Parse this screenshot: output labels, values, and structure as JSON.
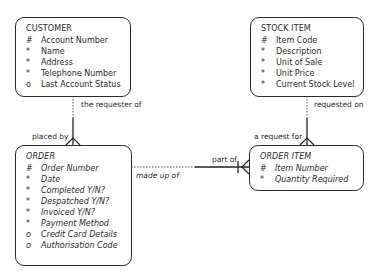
{
  "entities": {
    "customer": {
      "title": "CUSTOMER",
      "attributes": [
        {
          "mark": "#",
          "name": "Account Number"
        },
        {
          "mark": "*",
          "name": "Name"
        },
        {
          "mark": "*",
          "name": "Address"
        },
        {
          "mark": "*",
          "name": "Telephone Number"
        },
        {
          "mark": "o",
          "name": "Last Account Status"
        }
      ]
    },
    "stock_item": {
      "title": "STOCK ITEM",
      "attributes": [
        {
          "mark": "#",
          "name": "Item Code"
        },
        {
          "mark": "*",
          "name": "Description"
        },
        {
          "mark": "*",
          "name": "Unit of Sale"
        },
        {
          "mark": "*",
          "name": "Unit Price"
        },
        {
          "mark": "*",
          "name": "Current Stock Level"
        }
      ]
    },
    "order": {
      "title": "ORDER",
      "attributes": [
        {
          "mark": "#",
          "name": "Order Number"
        },
        {
          "mark": "*",
          "name": "Date"
        },
        {
          "mark": "*",
          "name": "Completed Y/N?"
        },
        {
          "mark": "*",
          "name": "Despatched Y/N?"
        },
        {
          "mark": "*",
          "name": "Invoiced Y/N?"
        },
        {
          "mark": "*",
          "name": "Payment Method"
        },
        {
          "mark": "o",
          "name": "Credit Card Details"
        },
        {
          "mark": "o",
          "name": "Authorisation Code"
        }
      ]
    },
    "order_item": {
      "title": "ORDER ITEM",
      "attributes": [
        {
          "mark": "#",
          "name": "Item Number"
        },
        {
          "mark": "*",
          "name": "Quantity Required"
        }
      ]
    }
  },
  "relationships": {
    "customer_order": {
      "top_label": "the requester of",
      "bottom_label": "placed by"
    },
    "stock_orderitem": {
      "top_label": "requested on",
      "bottom_label": "a request for"
    },
    "order_orderitem": {
      "left_label": "made up of",
      "right_label": "part of"
    }
  }
}
